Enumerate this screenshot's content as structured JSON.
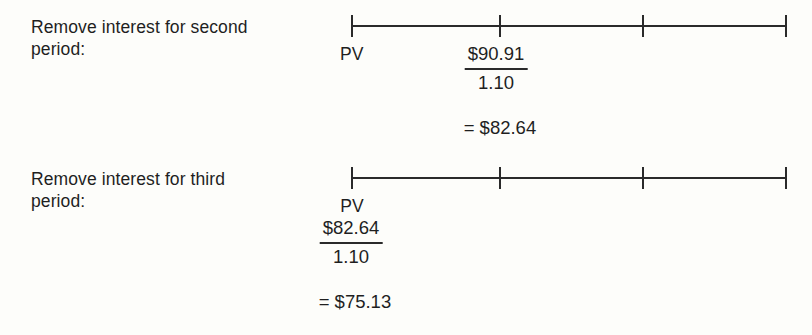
{
  "figure": {
    "background_color": "#fdfdfa",
    "line_color": "#2a2a2a",
    "text_color": "#1f1f1f"
  },
  "blocks": [
    {
      "label": "Remove interest for second\nperiod:",
      "timeline": {
        "tick_count": 4,
        "tick_positions_px": [
          351,
          500,
          643,
          786
        ]
      },
      "pv_label": "PV",
      "fraction": {
        "numerator": "$90.91",
        "denominator": "1.10"
      },
      "result": {
        "equals": "=",
        "value": "$82.64"
      }
    },
    {
      "label": "Remove interest for third\nperiod:",
      "timeline": {
        "tick_count": 4,
        "tick_positions_px": [
          351,
          500,
          643,
          786
        ]
      },
      "pv_label": "PV",
      "fraction": {
        "numerator": "$82.64",
        "denominator": "1.10"
      },
      "result": {
        "equals": "=",
        "value": "$75.13"
      }
    }
  ]
}
